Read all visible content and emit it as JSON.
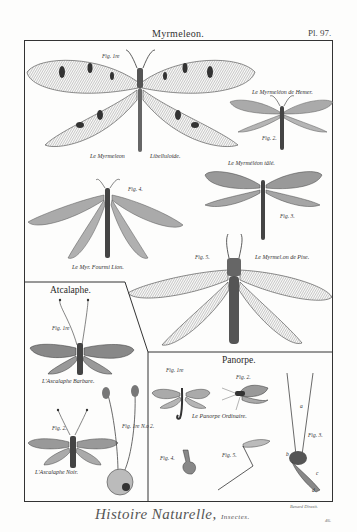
{
  "header": {
    "title": "Myrmeleon.",
    "plate_number": "Pl. 97."
  },
  "sections": {
    "myrmeleon": {
      "figures": [
        {
          "fig_label": "Fig. 1re",
          "caption_left": "Le Myrmeleon",
          "caption_right": "Libelluloide."
        },
        {
          "fig_label": "Fig. 2.",
          "caption": "Le Myrmeléon de Hemer."
        },
        {
          "fig_label": "Fig. 3.",
          "caption": "Le Myrméléon tâlé."
        },
        {
          "fig_label": "Fig. 4.",
          "caption": "Le Myr. Fourmi Lion."
        },
        {
          "fig_label": "Fig. 5.",
          "caption": "Le Myrmel.on de Pise."
        }
      ]
    },
    "atcalaphe": {
      "title": "Atcalaphe.",
      "figures": [
        {
          "fig_label": "Fig. 1re",
          "caption": "L'Ascalaphe Barbare."
        },
        {
          "fig_label": "Fig. 2.",
          "caption": "L'Ascalaphe Noir."
        },
        {
          "fig_label": "Fig. 1re N.o 2.",
          "caption": ""
        }
      ]
    },
    "panorpe": {
      "title": "Panorpe.",
      "figures": [
        {
          "fig_label": "Fig. 1re",
          "caption": "Le Panorpe Ordinaire."
        },
        {
          "fig_label": "Fig. 2.",
          "caption": ""
        },
        {
          "fig_label": "Fig. 3.",
          "caption": ""
        },
        {
          "fig_label": "Fig. 4.",
          "caption": ""
        },
        {
          "fig_label": "Fig. 5.",
          "caption": ""
        }
      ],
      "part_labels": [
        "a",
        "b",
        "c",
        "d"
      ]
    }
  },
  "footer": {
    "title": "Histoire Naturelle,",
    "subtitle": "Insectes.",
    "engraver": "Benard Direxit.",
    "page_number": "46."
  },
  "colors": {
    "ink": "#2a2a2a",
    "paper": "#fdfdfc",
    "wing_fill": "#9a9a9a",
    "wing_light": "#c8c8c8"
  }
}
